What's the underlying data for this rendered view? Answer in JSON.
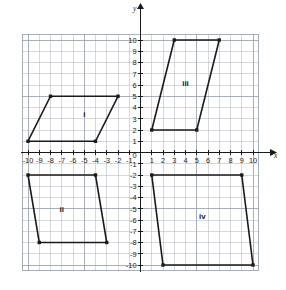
{
  "chart_data": {
    "type": "scatter",
    "title": "",
    "xlabel": "x",
    "ylabel": "y",
    "xlim": [
      -10.5,
      10.5
    ],
    "ylim": [
      -10.5,
      10.5
    ],
    "grid": true,
    "legend": "none",
    "x_ticks": [
      -10,
      -9,
      -8,
      -7,
      -6,
      -5,
      -4,
      -3,
      -2,
      -1,
      0,
      1,
      2,
      3,
      4,
      5,
      6,
      7,
      8,
      9,
      10
    ],
    "y_ticks": [
      -10,
      -9,
      -8,
      -7,
      -6,
      -5,
      -4,
      -3,
      -2,
      -1,
      0,
      1,
      2,
      3,
      4,
      5,
      6,
      7,
      8,
      9,
      10
    ],
    "x_tick_labels": [
      "-10",
      "-9",
      "-8",
      "-7",
      "-6",
      "-5",
      "-4",
      "-3",
      "-2",
      "-1",
      "0",
      "1",
      "2",
      "3",
      "4",
      "5",
      "6",
      "7",
      "8",
      "9",
      "10"
    ],
    "y_tick_labels": [
      "-10",
      "-9",
      "-8",
      "-7",
      "-6",
      "-5",
      "-4",
      "-3",
      "-2",
      "-1",
      "0",
      "1",
      "2",
      "3",
      "4",
      "5",
      "6",
      "7",
      "8",
      "9",
      "10"
    ],
    "shapes": [
      {
        "name": "i",
        "label": "i",
        "label_x": -5,
        "label_y": 3.4,
        "vertices": [
          [
            -8,
            5
          ],
          [
            -2,
            5
          ],
          [
            -4,
            1
          ],
          [
            -10,
            1
          ]
        ]
      },
      {
        "name": "ii",
        "label": "ii",
        "label_x": -7,
        "label_y": -5,
        "vertices": [
          [
            -10,
            -2
          ],
          [
            -4,
            -2
          ],
          [
            -3,
            -8
          ],
          [
            -9,
            -8
          ]
        ]
      },
      {
        "name": "iii",
        "label": "iii",
        "label_x": 4,
        "label_y": 6.2,
        "vertices": [
          [
            3,
            10
          ],
          [
            7,
            10
          ],
          [
            5,
            2
          ],
          [
            1,
            2
          ]
        ]
      },
      {
        "name": "iv",
        "label": "iv",
        "label_x": 5.5,
        "label_y": -5.6,
        "vertices": [
          [
            1,
            -2
          ],
          [
            9,
            -2
          ],
          [
            10,
            -10
          ],
          [
            2,
            -10
          ]
        ]
      }
    ],
    "colors": {
      "shape_stroke": "#1a1a1a",
      "axis": "#1a1a1a",
      "grid_minor": "#b9bec6",
      "grid_major": "#9aa1ab",
      "background": "#ffffff"
    }
  },
  "axis_labels": {
    "x": "x",
    "y": "y",
    "origin": "0"
  }
}
